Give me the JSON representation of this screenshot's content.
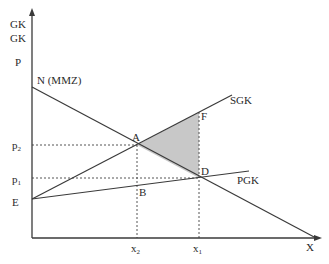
{
  "diagram": {
    "type": "economics-externality",
    "y_axis_labels": [
      "GK",
      "GK",
      "P"
    ],
    "x_axis_label": "X",
    "curves": {
      "demand": "N (MMZ)",
      "social_marginal_cost": "SGK",
      "private_marginal_cost": "PGK"
    },
    "points": {
      "A": "A",
      "B": "B",
      "D": "D",
      "E": "E",
      "F": "F"
    },
    "price_labels": {
      "p2": {
        "base": "p",
        "sub": "2"
      },
      "p1": {
        "base": "p",
        "sub": "1"
      }
    },
    "quantity_labels": {
      "x2": {
        "base": "x",
        "sub": "2"
      },
      "x1": {
        "base": "x",
        "sub": "1"
      }
    },
    "colors": {
      "line": "#3a3a3a",
      "shaded_area": "#c8c8c8",
      "dotted": "#555555"
    },
    "shaded_region": "triangle A-F-D (deadweight loss)"
  }
}
